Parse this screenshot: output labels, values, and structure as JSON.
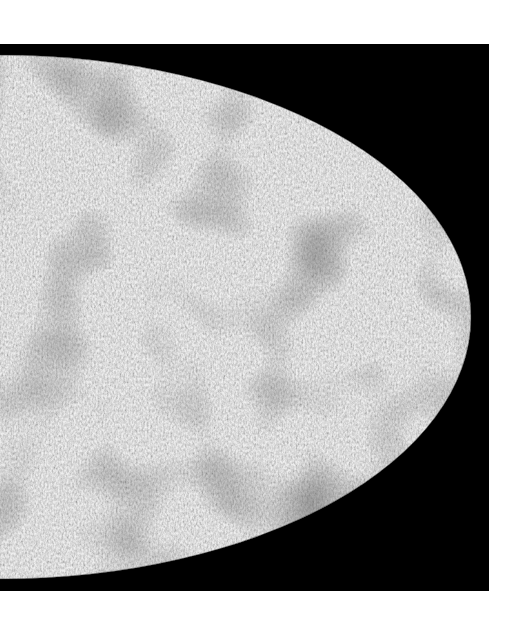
{
  "image": {
    "description": "Grayscale all-sky map (Mollweide projection, right half visible) with mottled noise texture on a black background",
    "background_color": "#000000",
    "page_color": "#ffffff",
    "map_tone_light": "#d0d0d0",
    "map_tone_dark": "#3a3a3a"
  }
}
